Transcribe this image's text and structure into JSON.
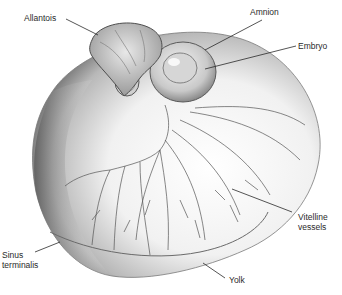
{
  "figure": {
    "type": "anatomical-illustration",
    "labels": {
      "allantois": "Allantois",
      "amnion": "Amnion",
      "embryo": "Embryo",
      "vitelline_vessels": "Vitelline\nvessels",
      "sinus_terminalis": "Sinus\nterminalis",
      "yolk": "Yolk"
    },
    "colors": {
      "ink": "#2a2a2a",
      "shade_dark": "#6e6e6e",
      "shade_mid": "#a9a9a9",
      "shade_light": "#e6e6e6",
      "background": "#ffffff"
    }
  }
}
